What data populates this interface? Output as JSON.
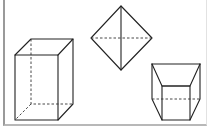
{
  "figure": {
    "shapes": [
      {
        "name": "rectangular prism",
        "position": "left"
      },
      {
        "name": "octahedron",
        "position": "top-center"
      },
      {
        "name": "frustum",
        "position": "right"
      }
    ],
    "colors": {
      "line": "#222222",
      "border": "#9a9a9a",
      "background": "#ffffff"
    }
  }
}
